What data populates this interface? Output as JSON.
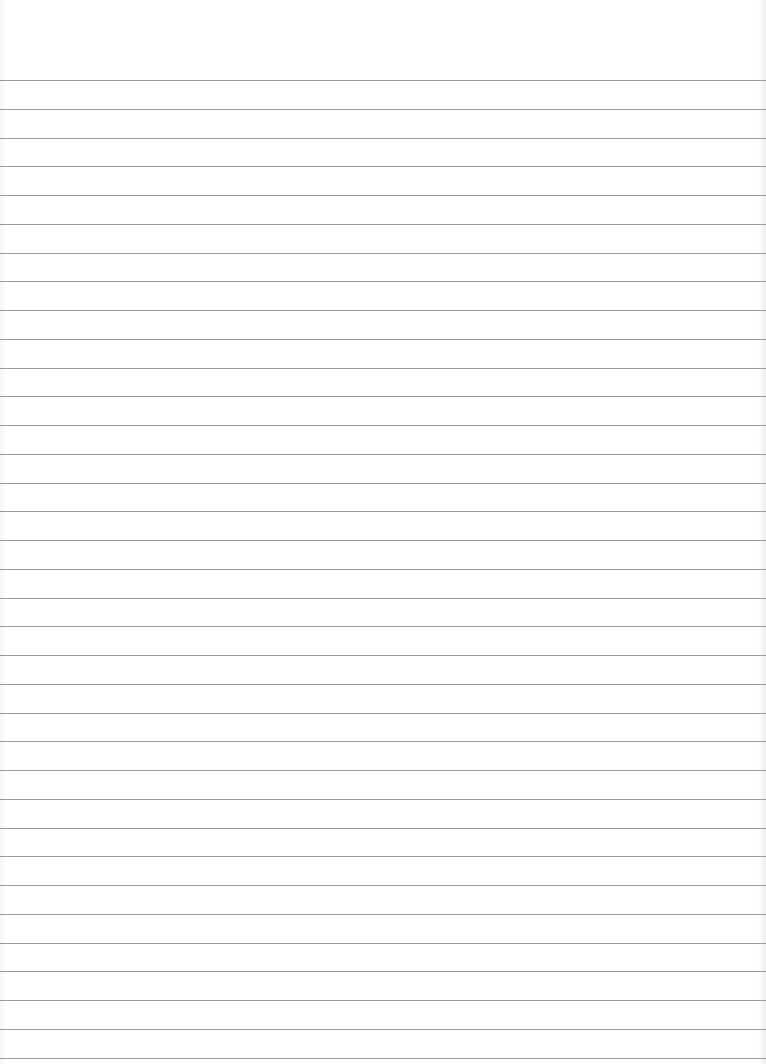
{
  "image": {
    "description": "Blank sheet of ruled notebook paper",
    "background_color": "#ffffff",
    "rule_color": "#9a9a9a",
    "rules": {
      "count": 35,
      "first_y": 80,
      "spacing": 28.75
    }
  }
}
